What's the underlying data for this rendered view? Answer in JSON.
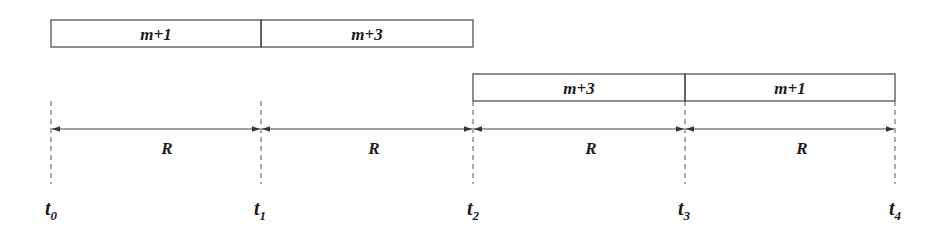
{
  "diagram": {
    "type": "timeline",
    "ticks": [
      {
        "name": "t",
        "sub": "0",
        "x": 51
      },
      {
        "name": "t",
        "sub": "1",
        "x": 261
      },
      {
        "name": "t",
        "sub": "2",
        "x": 473
      },
      {
        "name": "t",
        "sub": "3",
        "x": 685
      },
      {
        "name": "t",
        "sub": "4",
        "x": 895
      }
    ],
    "top_row": {
      "cells": [
        {
          "label": "m+1",
          "x0": 51,
          "x1": 261
        },
        {
          "label": "m+3",
          "x0": 261,
          "x1": 473
        }
      ]
    },
    "bottom_row": {
      "cells": [
        {
          "label": "m+3",
          "x0": 473,
          "x1": 685
        },
        {
          "label": "m+1",
          "x0": 685,
          "x1": 895
        }
      ]
    },
    "intervals": [
      {
        "label": "R",
        "from": "t0",
        "to": "t1"
      },
      {
        "label": "R",
        "from": "t1",
        "to": "t2"
      },
      {
        "label": "R",
        "from": "t2",
        "to": "t3"
      },
      {
        "label": "R",
        "from": "t3",
        "to": "t4"
      }
    ],
    "colors": {
      "stroke": "#333333",
      "text": "#1a1a1a",
      "background": "#ffffff"
    }
  }
}
